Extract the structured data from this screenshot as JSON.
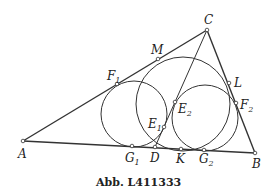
{
  "caption": "Abb. L411333",
  "colors": {
    "stroke": "#333333",
    "background": "#ffffff"
  },
  "points": {
    "A": {
      "label": "A",
      "x": 23,
      "y": 141
    },
    "B": {
      "label": "B",
      "x": 255,
      "y": 153
    },
    "C": {
      "label": "C",
      "x": 207,
      "y": 30
    },
    "D": {
      "label": "D",
      "x": 155,
      "y": 147
    },
    "K": {
      "label": "K",
      "x": 181,
      "y": 149
    },
    "M": {
      "label": "M",
      "x": 158,
      "y": 59
    },
    "L": {
      "label": "L",
      "x": 229,
      "y": 83
    },
    "F1": {
      "label": "F",
      "sub": "1",
      "x": 117,
      "y": 84
    },
    "F2": {
      "label": "F",
      "sub": "2",
      "x": 236,
      "y": 103
    },
    "G1": {
      "label": "G",
      "sub": "1",
      "x": 132,
      "y": 146
    },
    "G2": {
      "label": "G",
      "sub": "2",
      "x": 204,
      "y": 150
    },
    "E1": {
      "label": "E",
      "sub": "1",
      "x": 164,
      "y": 127
    },
    "E2": {
      "label": "E",
      "sub": "2",
      "x": 175,
      "y": 102
    }
  },
  "segments": [
    [
      "A",
      "B"
    ],
    [
      "B",
      "C"
    ],
    [
      "C",
      "A"
    ],
    [
      "C",
      "D"
    ]
  ],
  "circles": [
    {
      "name": "incircle-1",
      "cx": 134,
      "cy": 114,
      "r": 33
    },
    {
      "name": "incircle-2",
      "cx": 205,
      "cy": 118,
      "r": 33
    },
    {
      "name": "circle-MLK",
      "cx": 183,
      "cy": 104,
      "r": 47
    }
  ]
}
